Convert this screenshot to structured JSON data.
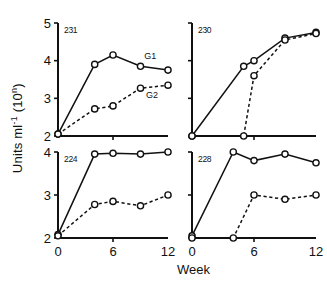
{
  "figure": {
    "ylabel_main": "Units  ml",
    "ylabel_sup": "-1",
    "ylabel_unit": "(10",
    "ylabel_unit_sup": "n",
    "ylabel_unit_close": ")",
    "ylabel_full": "Units ml-1 (10n)",
    "xlabel": "Week"
  },
  "legend": {
    "g1": "G1",
    "g2": "G2"
  },
  "chart_data": [
    {
      "type": "line",
      "title": "231",
      "panel": "top-left",
      "xlabel": "Week",
      "ylabel": "Units ml-1 (10n)",
      "xlim": [
        0,
        12
      ],
      "ylim": [
        2,
        5
      ],
      "xticks": [
        0,
        6,
        12
      ],
      "xtick_labels": [
        "0",
        "6",
        "12"
      ],
      "yticks": [
        2,
        3,
        4,
        5
      ],
      "ytick_labels": [
        "2",
        "3",
        "4",
        "5"
      ],
      "grid": false,
      "marker": "open-circle",
      "series": [
        {
          "name": "G1",
          "style": "solid",
          "x": [
            0,
            4,
            6,
            9,
            12
          ],
          "values": [
            2.05,
            3.9,
            4.15,
            3.85,
            3.75
          ]
        },
        {
          "name": "G2",
          "style": "dashed",
          "x": [
            0,
            4,
            6,
            9,
            12
          ],
          "values": [
            2.05,
            2.72,
            2.8,
            3.27,
            3.35
          ]
        }
      ]
    },
    {
      "type": "line",
      "title": "230",
      "panel": "top-right",
      "xlabel": "Week",
      "ylabel": "Units ml-1 (10n)",
      "xlim": [
        0,
        12
      ],
      "ylim": [
        2,
        5
      ],
      "xticks": [
        0,
        6,
        12
      ],
      "xtick_labels": [
        "0",
        "6",
        "12"
      ],
      "yticks": [
        2,
        3,
        4,
        5
      ],
      "ytick_labels": [
        "2",
        "3",
        "4",
        "5"
      ],
      "grid": false,
      "marker": "open-circle",
      "series": [
        {
          "name": "G1",
          "style": "solid",
          "x": [
            0,
            5,
            6,
            9,
            12
          ],
          "values": [
            2.0,
            3.85,
            4.0,
            4.6,
            4.75
          ]
        },
        {
          "name": "G2",
          "style": "dashed",
          "x": [
            0,
            5,
            6,
            9,
            12
          ],
          "values": [
            2.0,
            2.0,
            3.6,
            4.55,
            4.72
          ]
        }
      ]
    },
    {
      "type": "line",
      "title": "224",
      "panel": "bottom-left",
      "xlabel": "Week",
      "ylabel": "Units ml-1 (10n)",
      "xlim": [
        0,
        12
      ],
      "ylim": [
        2,
        4
      ],
      "xticks": [
        0,
        6,
        12
      ],
      "xtick_labels": [
        "0",
        "6",
        "12"
      ],
      "yticks": [
        2,
        3,
        4
      ],
      "ytick_labels": [
        "2",
        "3",
        "4"
      ],
      "grid": false,
      "marker": "open-circle",
      "series": [
        {
          "name": "G1",
          "style": "solid",
          "x": [
            0,
            4,
            6,
            9,
            12
          ],
          "values": [
            2.08,
            3.95,
            3.97,
            3.95,
            4.0
          ]
        },
        {
          "name": "G2",
          "style": "dashed",
          "x": [
            0,
            4,
            6,
            9,
            12
          ],
          "values": [
            2.05,
            2.78,
            2.85,
            2.75,
            3.0
          ]
        }
      ]
    },
    {
      "type": "line",
      "title": "228",
      "panel": "bottom-right",
      "xlabel": "Week",
      "ylabel": "Units ml-1 (10n)",
      "xlim": [
        0,
        12
      ],
      "ylim": [
        2,
        4
      ],
      "xticks": [
        0,
        6,
        12
      ],
      "xtick_labels": [
        "0",
        "6",
        "12"
      ],
      "yticks": [
        2,
        3,
        4
      ],
      "ytick_labels": [
        "2",
        "3",
        "4"
      ],
      "grid": false,
      "marker": "open-circle",
      "series": [
        {
          "name": "G1",
          "style": "solid",
          "x": [
            0,
            4,
            6,
            9,
            12
          ],
          "values": [
            2.05,
            4.0,
            3.8,
            3.95,
            3.75
          ]
        },
        {
          "name": "G2",
          "style": "dashed",
          "x": [
            0,
            4,
            6,
            9,
            12
          ],
          "values": [
            2.0,
            2.0,
            3.0,
            2.9,
            3.0
          ]
        }
      ]
    }
  ]
}
